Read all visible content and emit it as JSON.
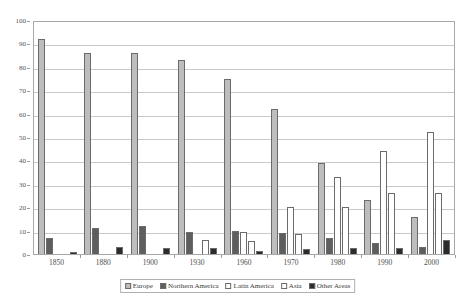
{
  "chart_data": {
    "type": "bar",
    "title": "",
    "subtitle": "",
    "xlabel": "",
    "ylabel": "",
    "categories": [
      "1850",
      "1880",
      "1900",
      "1930",
      "1960",
      "1970",
      "1980",
      "1990",
      "2000"
    ],
    "ylim": [
      0,
      100
    ],
    "y_ticks": [
      0,
      10,
      20,
      30,
      40,
      50,
      60,
      70,
      80,
      90,
      100
    ],
    "grid": true,
    "legend_position": "bottom",
    "series": [
      {
        "name": "Europe",
        "color": "#bdbdbd",
        "values": [
          92,
          86,
          86,
          83,
          75,
          62,
          39,
          23,
          16
        ]
      },
      {
        "name": "Northern America",
        "color": "#5e5e5e",
        "values": [
          7,
          11,
          12,
          9.5,
          10,
          9,
          7,
          4.5,
          3
        ]
      },
      {
        "name": "Latin America",
        "color": "#ffffff",
        "values": [
          0,
          0,
          0,
          0,
          9.5,
          20,
          33,
          44,
          52
        ]
      },
      {
        "name": "Asia",
        "color": "#ffffff",
        "values": [
          0,
          0,
          0,
          6,
          5.5,
          8.5,
          20,
          26,
          26
        ]
      },
      {
        "name": "Other Areas",
        "color": "#2b2b2b",
        "values": [
          1,
          3,
          2.5,
          2.5,
          1.5,
          2,
          2.5,
          2.5,
          6
        ]
      }
    ]
  }
}
